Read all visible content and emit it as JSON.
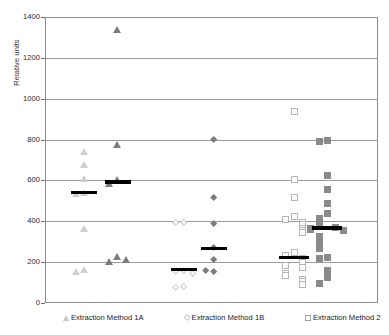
{
  "chart_data": {
    "type": "scatter",
    "title": "",
    "xlabel": "",
    "ylabel": "Relative units",
    "ylim": [
      0,
      1400
    ],
    "ytick_step": 200,
    "yticks": [
      0,
      200,
      400,
      600,
      800,
      1000,
      1200,
      1400
    ],
    "ytick_labels": [
      "0",
      "200",
      "400",
      "600",
      "800",
      "1000",
      "1200",
      "1400"
    ],
    "grid": "horizontal",
    "legend_position": "below-axis",
    "legend": [
      {
        "label": "Extraction Method 1A",
        "marker": "triangle"
      },
      {
        "label": "Extraction Method 1B",
        "marker": "diamond"
      },
      {
        "label": "Extraction Method 2",
        "marker": "square"
      }
    ],
    "series": [
      {
        "name": "Extraction Method 1A",
        "marker": "triangle",
        "fill": "open",
        "group": "1A-open",
        "x": 0.115,
        "values": [
          745,
          680,
          615,
          545,
          540,
          370,
          170,
          160
        ],
        "mean": 545
      },
      {
        "name": "Extraction Method 1A",
        "marker": "triangle",
        "fill": "filled",
        "group": "1A-filled",
        "x": 0.215,
        "values": [
          1345,
          780,
          610,
          590,
          230,
          205,
          215
        ],
        "mean": 597
      },
      {
        "name": "Extraction Method 1B",
        "marker": "diamond",
        "fill": "open",
        "group": "1B-open",
        "x": 0.415,
        "values": [
          400,
          398,
          165,
          160,
          150,
          85,
          78
        ],
        "mean": 168
      },
      {
        "name": "Extraction Method 1B",
        "marker": "diamond",
        "fill": "filled",
        "group": "1B-filled",
        "x": 0.505,
        "values": [
          805,
          520,
          395,
          275,
          215,
          160,
          165
        ],
        "mean": 272
      },
      {
        "name": "Extraction Method 2",
        "marker": "square",
        "fill": "open",
        "group": "2-open",
        "x": 0.745,
        "values": [
          940,
          610,
          520,
          430,
          415,
          400,
          390,
          370,
          360,
          350,
          250,
          235,
          225,
          205,
          190,
          180,
          150,
          140,
          120,
          110,
          95
        ],
        "mean": 228
      },
      {
        "name": "Extraction Method 2",
        "marker": "square",
        "fill": "filled",
        "group": "2-filled",
        "x": 0.845,
        "values": [
          800,
          795,
          630,
          560,
          490,
          445,
          420,
          400,
          385,
          375,
          370,
          365,
          360,
          330,
          300,
          270,
          230,
          225,
          165,
          130,
          100
        ],
        "mean": 372
      }
    ]
  },
  "axis": {
    "ylabel": "Relative units"
  }
}
